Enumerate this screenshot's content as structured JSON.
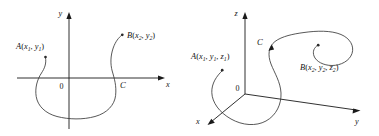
{
  "figure": {
    "stroke_color": "#3a3a3a",
    "axis_color": "#1a1a1a",
    "background": "#ffffff"
  },
  "panel_2d": {
    "name": "two-dimensional-curve-diagram",
    "axes": {
      "x_label": "x",
      "y_label": "y",
      "origin_label": "0"
    },
    "points": {
      "start": {
        "name": "A",
        "coords": "(x1, y1)",
        "label_main": "A",
        "sub1": "1",
        "sub2": "1",
        "var1": "x",
        "var2": "y"
      },
      "end": {
        "name": "B",
        "coords": "(x2, y2)",
        "label_main": "B",
        "sub1": "2",
        "sub2": "2",
        "var1": "x",
        "var2": "y"
      }
    },
    "curve_label": "C"
  },
  "panel_3d": {
    "name": "three-dimensional-curve-diagram",
    "axes": {
      "x_label": "x",
      "y_label": "y",
      "z_label": "z",
      "origin_label": "0"
    },
    "points": {
      "start": {
        "name": "A",
        "coords": "(x1, y1, z1)",
        "label_main": "A",
        "sub1": "1",
        "sub2": "1",
        "sub3": "1",
        "var1": "x",
        "var2": "y",
        "var3": "z"
      },
      "end": {
        "name": "B",
        "coords": "(x2, y2, z2)",
        "label_main": "B",
        "sub1": "2",
        "sub2": "2",
        "sub3": "2",
        "var1": "x",
        "var2": "y",
        "var3": "z"
      }
    },
    "curve_label": "C"
  }
}
